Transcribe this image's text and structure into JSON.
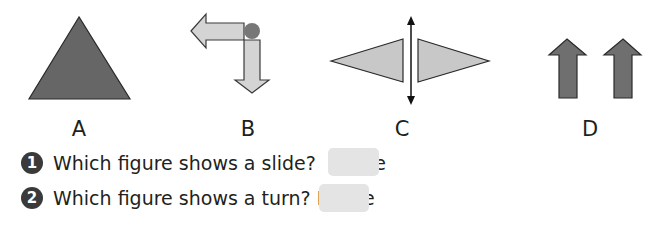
{
  "figures": [
    {
      "id": "A",
      "label": "A",
      "shape": "triangle",
      "color": "#666666"
    },
    {
      "id": "B",
      "label": "B",
      "shape": "turned-arrows",
      "color": "#d4d4d4",
      "pivot_color": "#777777"
    },
    {
      "id": "C",
      "label": "C",
      "shape": "flipped-triangles",
      "color": "#c8c8c8"
    },
    {
      "id": "D",
      "label": "D",
      "shape": "slid-arrows",
      "color": "#6f6f6f"
    }
  ],
  "questions": [
    {
      "number": "1",
      "text": "Which figure shows a slide?  Figure",
      "answer": ""
    },
    {
      "number": "2",
      "text": "Which figure shows a turn? Figure",
      "answer": ""
    }
  ],
  "colors": {
    "dark_fill": "#666666",
    "light_fill": "#d0d0d0",
    "answer_box": "#e4e4e4",
    "number_badge": "#3a3a3a"
  }
}
